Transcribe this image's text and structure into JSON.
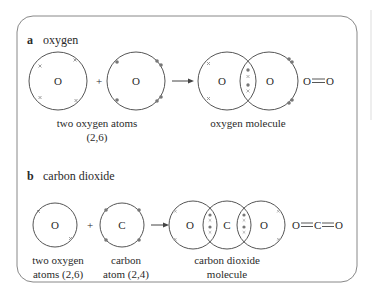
{
  "colors": {
    "line": "#555555",
    "dot": "#777777",
    "frame": "#888888",
    "text": "#2a2a2a"
  },
  "panel_a": {
    "letter": "a",
    "title": "oxygen",
    "atom1_symbol": "O",
    "atom2_symbol": "O",
    "plus": "+",
    "molecule_left_symbol": "O",
    "molecule_right_symbol": "O",
    "formula": "O=O",
    "formula_left": "O",
    "formula_right": "O",
    "reactant_label_line1": "two oxygen atoms",
    "reactant_label_line2": "(2,6)",
    "product_label": "oxygen molecule"
  },
  "panel_b": {
    "letter": "b",
    "title": "carbon dioxide",
    "atom1_symbol": "O",
    "atom2_symbol": "C",
    "plus": "+",
    "molecule_symbols": [
      "O",
      "C",
      "O"
    ],
    "formula_parts": [
      "O",
      "C",
      "O"
    ],
    "label1_line1": "two oxygen",
    "label1_line2": "atoms (2,6)",
    "label2_line1": "carbon",
    "label2_line2": "atom (2,4)",
    "product_line1": "carbon dioxide",
    "product_line2": "molecule"
  }
}
